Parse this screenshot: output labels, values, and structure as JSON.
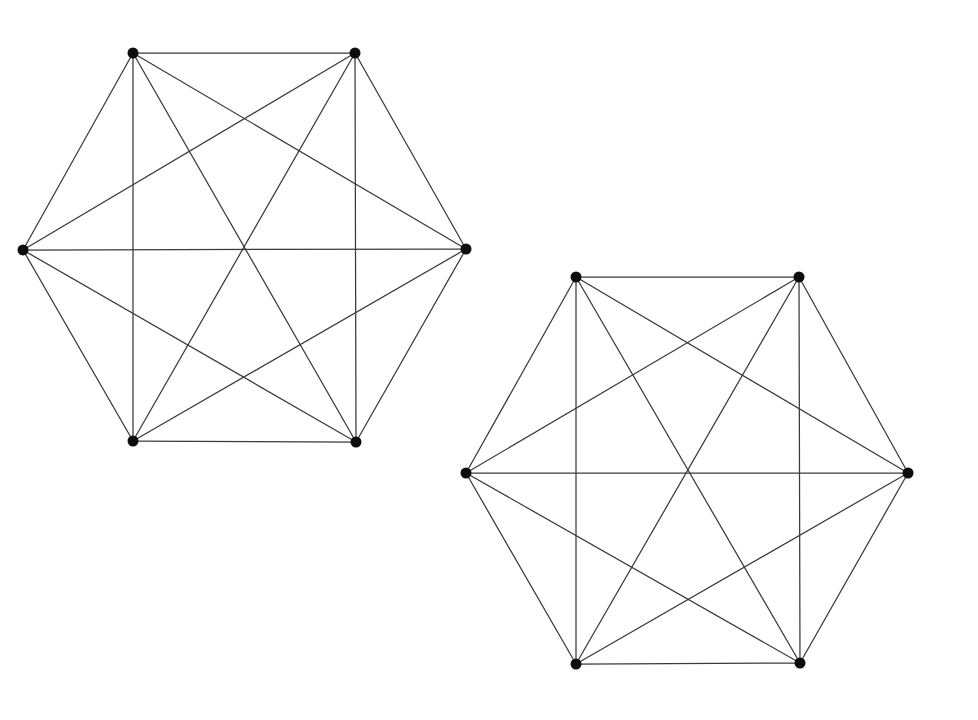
{
  "figure": {
    "background_color": "#ffffff",
    "edge_color": "#3a3a3a",
    "vertex_color": "#0d0d0d",
    "edge_width": 1.25,
    "vertex_radius": 5.5,
    "width": 978,
    "height": 720
  },
  "graph_data": {
    "type": "diagram",
    "diagram_kind": "graph-drawing",
    "description": "Two separate drawings of the complete graph K6, each laid out with its six vertices on the corners of a regular hexagon so that all fifteen edges are visible as hexagon sides, long diagonals through the center, and short diagonals.",
    "graph_count": 2,
    "graphs": [
      {
        "name": "complete-graph-left",
        "label": "",
        "vertex_count": 6,
        "edge_count": 15,
        "degree_sequence": [
          5,
          5,
          5,
          5,
          5,
          5
        ],
        "center": [
          245,
          248
        ],
        "vertices": [
          {
            "id": "A",
            "role": "top-left",
            "x": 133,
            "y": 53
          },
          {
            "id": "B",
            "role": "top-right",
            "x": 355,
            "y": 53
          },
          {
            "id": "C",
            "role": "right",
            "x": 466,
            "y": 249
          },
          {
            "id": "D",
            "role": "bottom-right",
            "x": 356,
            "y": 442
          },
          {
            "id": "E",
            "role": "bottom-left",
            "x": 133,
            "y": 441
          },
          {
            "id": "F",
            "role": "left",
            "x": 23,
            "y": 250
          }
        ],
        "edges": [
          [
            "A",
            "B"
          ],
          [
            "A",
            "C"
          ],
          [
            "A",
            "D"
          ],
          [
            "A",
            "E"
          ],
          [
            "A",
            "F"
          ],
          [
            "B",
            "C"
          ],
          [
            "B",
            "D"
          ],
          [
            "B",
            "E"
          ],
          [
            "B",
            "F"
          ],
          [
            "C",
            "D"
          ],
          [
            "C",
            "E"
          ],
          [
            "C",
            "F"
          ],
          [
            "D",
            "E"
          ],
          [
            "D",
            "F"
          ],
          [
            "E",
            "F"
          ]
        ]
      },
      {
        "name": "complete-graph-right",
        "label": "",
        "vertex_count": 6,
        "edge_count": 15,
        "degree_sequence": [
          5,
          5,
          5,
          5,
          5,
          5
        ],
        "center": [
          687,
          470
        ],
        "vertices": [
          {
            "id": "A",
            "role": "top-left",
            "x": 576,
            "y": 277
          },
          {
            "id": "B",
            "role": "top-right",
            "x": 799,
            "y": 277
          },
          {
            "id": "C",
            "role": "right",
            "x": 908,
            "y": 473
          },
          {
            "id": "D",
            "role": "bottom-right",
            "x": 800,
            "y": 663
          },
          {
            "id": "E",
            "role": "bottom-left",
            "x": 576,
            "y": 664
          },
          {
            "id": "F",
            "role": "left",
            "x": 466,
            "y": 473
          }
        ],
        "edges": [
          [
            "A",
            "B"
          ],
          [
            "A",
            "C"
          ],
          [
            "A",
            "D"
          ],
          [
            "A",
            "E"
          ],
          [
            "A",
            "F"
          ],
          [
            "B",
            "C"
          ],
          [
            "B",
            "D"
          ],
          [
            "B",
            "E"
          ],
          [
            "B",
            "F"
          ],
          [
            "C",
            "D"
          ],
          [
            "C",
            "E"
          ],
          [
            "C",
            "F"
          ],
          [
            "D",
            "E"
          ],
          [
            "D",
            "F"
          ],
          [
            "E",
            "F"
          ]
        ]
      }
    ]
  }
}
